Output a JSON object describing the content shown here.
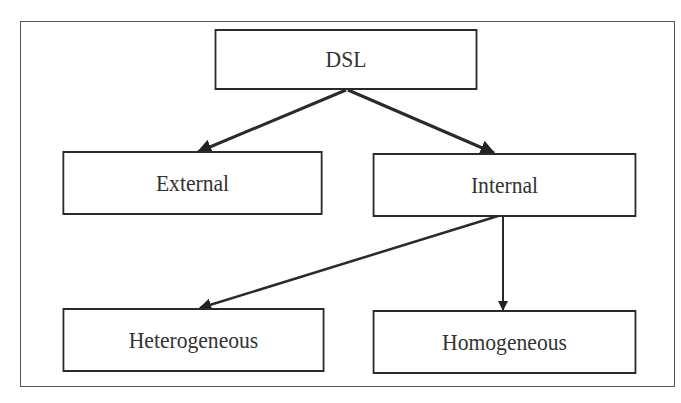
{
  "diagram": {
    "type": "tree",
    "nodes": [
      {
        "id": "dsl",
        "label": "DSL"
      },
      {
        "id": "external",
        "label": "External"
      },
      {
        "id": "internal",
        "label": "Internal"
      },
      {
        "id": "heterogeneous",
        "label": "Heterogeneous"
      },
      {
        "id": "homogeneous",
        "label": "Homogeneous"
      }
    ],
    "edges": [
      {
        "from": "dsl",
        "to": "external"
      },
      {
        "from": "dsl",
        "to": "internal"
      },
      {
        "from": "internal",
        "to": "heterogeneous"
      },
      {
        "from": "internal",
        "to": "homogeneous"
      }
    ]
  }
}
